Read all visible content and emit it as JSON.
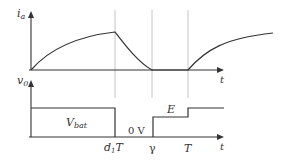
{
  "diagram": {
    "top_plot": {
      "y_label": "i",
      "y_label_sub": "a",
      "x_label": "t"
    },
    "bottom_plot": {
      "y_label": "v",
      "y_label_sub": "0",
      "x_label": "t",
      "level_labels": {
        "vbat_main": "V",
        "vbat_sub": "bat",
        "zero": "0 V",
        "e": "E"
      },
      "tick_labels": {
        "d1t_d": "d",
        "d1t_sub": "1",
        "d1t_t": "T",
        "gamma": "γ",
        "period": "T"
      }
    },
    "colors": {
      "line": "#333333",
      "guide": "#bbbbbb"
    }
  }
}
